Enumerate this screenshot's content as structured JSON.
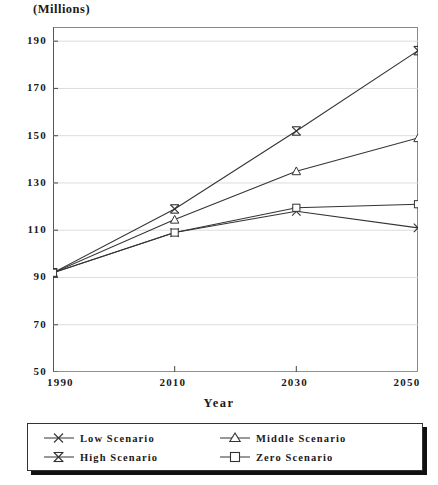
{
  "chart_data": {
    "type": "line",
    "title": "",
    "units_caption": "(Millions)",
    "xlabel": "Year",
    "ylabel": "",
    "categories": [
      1990,
      2010,
      2030,
      2050
    ],
    "x": [
      1990,
      2010,
      2030,
      2050
    ],
    "xlim": [
      1990,
      2050
    ],
    "ylim": [
      50,
      196
    ],
    "yticks": [
      50,
      70,
      90,
      110,
      130,
      150,
      170,
      190
    ],
    "xticks": [
      1990,
      2010,
      2030,
      2050
    ],
    "ytick_labels": [
      "50",
      "70",
      "90",
      "110",
      "130",
      "150",
      "170",
      "190"
    ],
    "xtick_labels": [
      "1990",
      "2010",
      "2030",
      "2050"
    ],
    "grid": true,
    "grid_axis": "y",
    "legend_position": "below-plot",
    "series": [
      {
        "name": "Low Scenario",
        "marker": "x-cross",
        "color": "#333333",
        "values": [
          92,
          109,
          118,
          111
        ]
      },
      {
        "name": "High Scenario",
        "marker": "bowtie-asterisk",
        "color": "#333333",
        "values": [
          92,
          119,
          152,
          186
        ]
      },
      {
        "name": "Middle Scenario",
        "marker": "triangle",
        "color": "#333333",
        "values": [
          92,
          114.5,
          135,
          149
        ]
      },
      {
        "name": "Zero Scenario",
        "marker": "square",
        "color": "#333333",
        "values": [
          92,
          109,
          119.5,
          121
        ]
      }
    ],
    "legend_entries": [
      {
        "label": "Low Scenario",
        "marker": "x-cross"
      },
      {
        "label": "High Scenario",
        "marker": "bowtie-asterisk"
      },
      {
        "label": "Middle Scenario",
        "marker": "triangle"
      },
      {
        "label": "Zero Scenario",
        "marker": "square"
      }
    ]
  },
  "footer": {
    "caption": ""
  }
}
